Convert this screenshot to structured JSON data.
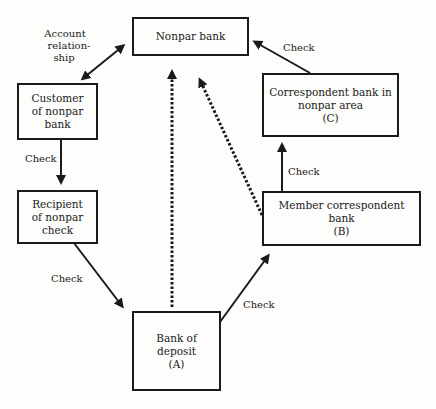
{
  "diagram": {
    "nodes": {
      "nonpar_bank": {
        "lines": [
          "Nonpar bank"
        ]
      },
      "customer": {
        "lines": [
          "Customer",
          "of nonpar",
          "bank"
        ]
      },
      "recipient": {
        "lines": [
          "Recipient",
          "of nonpar",
          "check"
        ]
      },
      "correspondent_c": {
        "lines": [
          "Correspondent bank in",
          "nonpar area",
          "(C)"
        ]
      },
      "member_b": {
        "lines": [
          "Member correspondent bank",
          "(B)"
        ]
      },
      "deposit_a": {
        "lines": [
          "Bank of",
          "deposit",
          "(A)"
        ]
      }
    },
    "labels": {
      "account": {
        "lines": [
          "Account",
          "relation-",
          "ship"
        ]
      },
      "check_customer_recipient": "Check",
      "check_recipient_deposit": "Check",
      "check_deposit_member": "Check",
      "check_member_correspondent": "Check",
      "check_correspondent_nonpar": "Check"
    },
    "colors": {
      "ink": "#1a1a1a",
      "paper": "#fdfdfb"
    }
  }
}
